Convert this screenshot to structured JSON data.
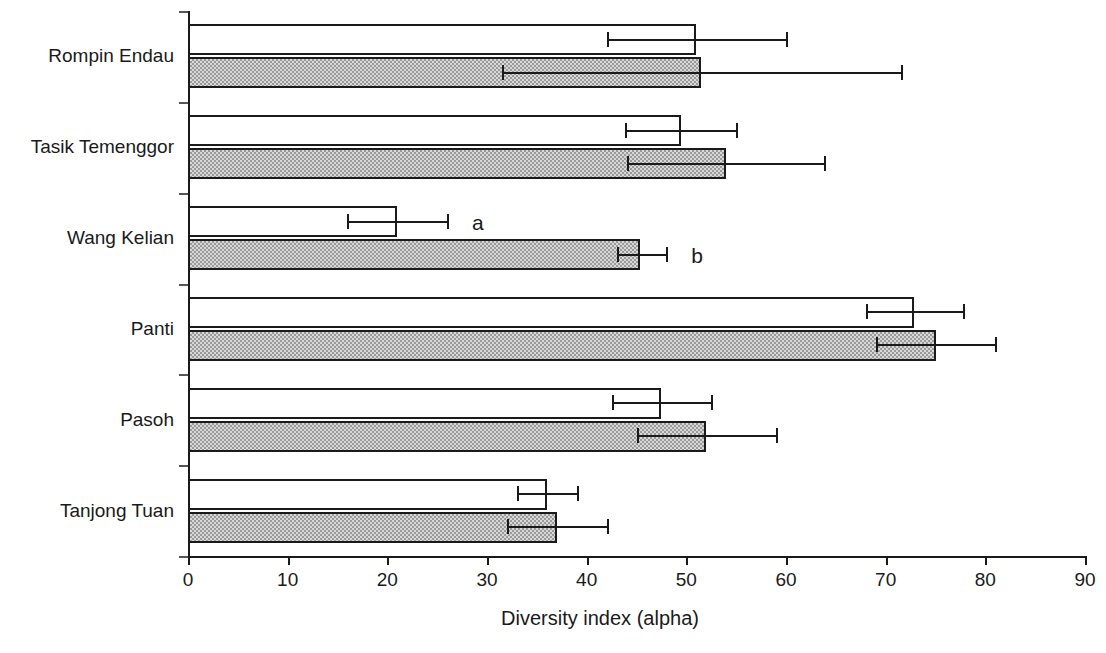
{
  "chart_data": {
    "type": "bar",
    "orientation": "horizontal",
    "title": "",
    "xlabel": "Diversity index (alpha)",
    "ylabel": "",
    "xlim": [
      0,
      90
    ],
    "xticks": [
      0,
      10,
      20,
      30,
      40,
      50,
      60,
      70,
      80,
      90
    ],
    "grid": false,
    "legend_position": "none",
    "categories": [
      "Rompin Endau",
      "Tasik Temenggor",
      "Wang Kelian",
      "Panti",
      "Pasoh",
      "Tanjong Tuan"
    ],
    "series": [
      {
        "name": "a",
        "fill": "white",
        "values": [
          51.0,
          49.5,
          21.0,
          72.8,
          47.5,
          36.0
        ],
        "err_low": [
          42.0,
          43.8,
          16.0,
          68.0,
          42.5,
          33.0
        ],
        "err_high": [
          60.0,
          55.0,
          26.0,
          77.8,
          52.5,
          39.0
        ]
      },
      {
        "name": "b",
        "fill": "gray-dither",
        "values": [
          51.5,
          54.0,
          45.4,
          75.0,
          52.0,
          37.0
        ],
        "err_low": [
          31.5,
          44.0,
          43.0,
          69.0,
          45.0,
          32.0
        ],
        "err_high": [
          71.5,
          63.8,
          48.0,
          81.0,
          59.0,
          42.0
        ]
      }
    ],
    "annotations": [
      {
        "text": "a",
        "x": 28.5,
        "category": "Wang Kelian",
        "series": "a"
      },
      {
        "text": "b",
        "x": 50.5,
        "category": "Wang Kelian",
        "series": "b"
      }
    ]
  },
  "axis": {
    "x_tick_labels": [
      "0",
      "10",
      "20",
      "30",
      "40",
      "50",
      "60",
      "70",
      "80",
      "90"
    ],
    "x_title": "Diversity index (alpha)"
  },
  "colors": {
    "ink": "#1a1a1a",
    "bar_a_fill": "#ffffff",
    "bar_b_fill": "#d8d8d8",
    "background": "#ffffff"
  }
}
